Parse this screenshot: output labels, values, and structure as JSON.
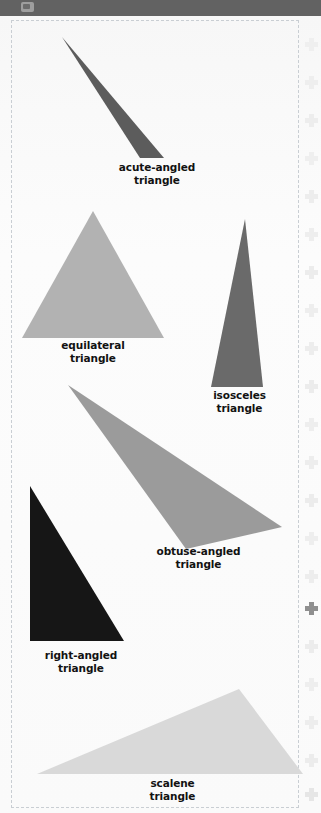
{
  "window": {
    "topbar_color": "#626262",
    "topbar_icon": "app-window-icon"
  },
  "page": {
    "background": "#fbfbfb",
    "border_style": "dashed",
    "border_color": "#c9ced3"
  },
  "figures": [
    {
      "id": "acute-angled",
      "label": "acute-angled\ntriangle",
      "fill": "#5c5c5c",
      "points": "102,121 0,0 78,121",
      "box": {
        "left": 62,
        "top": 21,
        "width": 180,
        "height": 126
      },
      "label_box": {
        "left": 92,
        "top": 145,
        "width": 130
      }
    },
    {
      "id": "equilateral",
      "label": "equilateral\ntriangle",
      "fill": "#b2b2b2",
      "points": "71,0 0,127 142,127",
      "box": {
        "left": 22,
        "top": 195,
        "width": 145,
        "height": 130
      },
      "label_box": {
        "left": 28,
        "top": 323,
        "width": 130
      }
    },
    {
      "id": "isosceles",
      "label": "isosceles\ntriangle",
      "fill": "#6a6a6a",
      "points": "34,0 0,168 52,168",
      "box": {
        "left": 211,
        "top": 203,
        "width": 56,
        "height": 170
      },
      "label_box": {
        "left": 177,
        "top": 373,
        "width": 125
      }
    },
    {
      "id": "obtuse-angled",
      "label": "obtuse-angled\ntriangle",
      "fill": "#9b9b9b",
      "points": "0,0 118,164 214,142",
      "box": {
        "left": 68,
        "top": 369,
        "width": 216,
        "height": 166
      },
      "label_box": {
        "left": 131,
        "top": 529,
        "width": 135
      }
    },
    {
      "id": "right-angled",
      "label": "right-angled\ntriangle",
      "fill": "#161616",
      "points": "0,0 0,155 94,155",
      "box": {
        "left": 30,
        "top": 470,
        "width": 96,
        "height": 157
      },
      "label_box": {
        "left": 16,
        "top": 633,
        "width": 130
      }
    },
    {
      "id": "scalene",
      "label": "scalene\ntriangle",
      "fill": "#d9d9d9",
      "points": "0,85 202,0 266,85",
      "box": {
        "left": 37,
        "top": 673,
        "width": 268,
        "height": 87
      },
      "label_box": {
        "left": 110,
        "top": 761,
        "width": 125
      }
    }
  ],
  "edge_marks": {
    "icon": "plus-cross-icon",
    "faint_color": "#eeeeee",
    "strong_color": "#8f8f8f",
    "items": [
      {
        "top": 22,
        "color": "#efefef"
      },
      {
        "top": 60,
        "color": "#eeeeee"
      },
      {
        "top": 98,
        "color": "#ededed"
      },
      {
        "top": 136,
        "color": "#efefef"
      },
      {
        "top": 174,
        "color": "#ededed"
      },
      {
        "top": 212,
        "color": "#eeeeee"
      },
      {
        "top": 250,
        "color": "#ececec"
      },
      {
        "top": 288,
        "color": "#eeeeee"
      },
      {
        "top": 326,
        "color": "#ededed"
      },
      {
        "top": 364,
        "color": "#ececec"
      },
      {
        "top": 402,
        "color": "#eeeeee"
      },
      {
        "top": 440,
        "color": "#ededed"
      },
      {
        "top": 478,
        "color": "#ececec"
      },
      {
        "top": 516,
        "color": "#eeeeee"
      },
      {
        "top": 554,
        "color": "#ededed"
      },
      {
        "top": 586,
        "color": "#8f8f8f"
      },
      {
        "top": 624,
        "color": "#ececec"
      },
      {
        "top": 662,
        "color": "#eeeeee"
      },
      {
        "top": 700,
        "color": "#ededed"
      },
      {
        "top": 738,
        "color": "#ececec"
      },
      {
        "top": 772,
        "color": "#e6e6e6"
      }
    ]
  }
}
